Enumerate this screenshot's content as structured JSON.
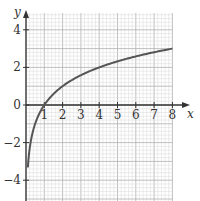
{
  "chart_data": {
    "type": "line",
    "title": "",
    "xlabel": "x",
    "ylabel": "y",
    "xlim": [
      0,
      8
    ],
    "ylim": [
      -5,
      5
    ],
    "x_ticks": [
      "1",
      "2",
      "3",
      "4",
      "5",
      "6",
      "7",
      "8"
    ],
    "y_ticks": [
      "4",
      "2",
      "0",
      "−2",
      "−4"
    ],
    "grid": true,
    "series": [
      {
        "name": "y = log2(x)",
        "x": [
          0.1,
          0.25,
          0.5,
          1,
          2,
          3,
          4,
          5,
          6,
          7,
          8
        ],
        "y": [
          -3.32,
          -2,
          -1,
          0,
          1,
          1.58,
          2,
          2.32,
          2.58,
          2.81,
          3
        ]
      }
    ]
  },
  "colors": {
    "grid_minor": "#d8d8d8",
    "grid_major": "#b0b0b0",
    "curve": "#555555",
    "axis": "#333333"
  }
}
